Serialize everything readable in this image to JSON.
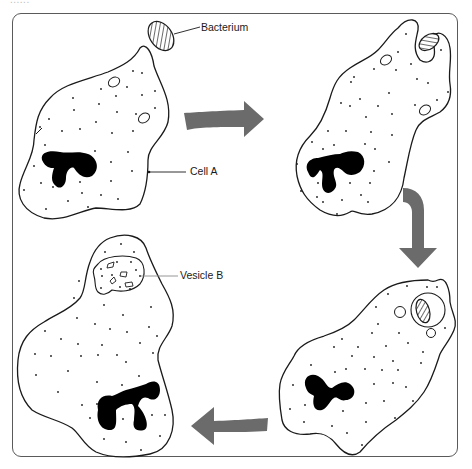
{
  "header": {
    "cropped_text": "......"
  },
  "diagram": {
    "colors": {
      "outline": "#1a1a1a",
      "arrow": "#6b6b6b",
      "frame": "#5a5a5a",
      "nucleus": "#000000",
      "background": "#ffffff"
    },
    "labels": {
      "bacterium": "Bacterium",
      "cell_a": "Cell  A",
      "vesicle_b": "Vesicle B"
    },
    "stages": [
      {
        "id": 1,
        "position": "top-left",
        "description": "Cell A approaching bacterium"
      },
      {
        "id": 2,
        "position": "top-right",
        "description": "Cell extends around bacterium"
      },
      {
        "id": 3,
        "position": "bottom-right",
        "description": "Bacterium enclosed in vacuole"
      },
      {
        "id": 4,
        "position": "bottom-left",
        "description": "Bacterium digested in Vesicle B"
      }
    ],
    "arrows": [
      {
        "from": 1,
        "to": 2,
        "direction": "right"
      },
      {
        "from": 2,
        "to": 3,
        "direction": "down"
      },
      {
        "from": 3,
        "to": 4,
        "direction": "left"
      }
    ]
  }
}
